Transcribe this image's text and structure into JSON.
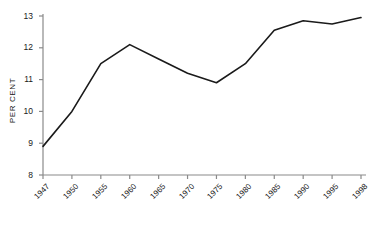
{
  "chart_data": {
    "type": "line",
    "title": "",
    "xlabel": "",
    "ylabel": "PER CENT",
    "ylim": [
      8,
      13
    ],
    "grid": false,
    "legend": "none",
    "categories": [
      "1947",
      "1950",
      "1955",
      "1960",
      "1965",
      "1970",
      "1975",
      "1980",
      "1985",
      "1990",
      "1995",
      "1998"
    ],
    "values": [
      8.9,
      10.0,
      11.5,
      12.1,
      11.65,
      11.2,
      10.9,
      11.5,
      12.55,
      12.85,
      12.75,
      12.95
    ],
    "ytick_labels": [
      "13",
      "12",
      "11",
      "10",
      "9",
      "8"
    ],
    "ytick_values": [
      13,
      12,
      11,
      10,
      9,
      8
    ],
    "series": [
      {
        "name": "",
        "values": [
          8.9,
          10.0,
          11.5,
          12.1,
          11.65,
          11.2,
          10.9,
          11.5,
          12.55,
          12.85,
          12.75,
          12.95
        ]
      }
    ]
  },
  "axis": {
    "y_title": "PER CENT"
  }
}
